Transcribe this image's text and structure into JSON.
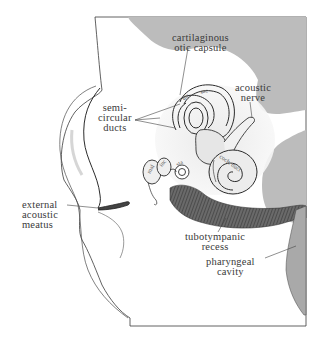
{
  "figure": {
    "type": "anatomical illustration",
    "colors": {
      "capsule_gray": "#bdbdbd",
      "line": "#2b2b2b",
      "shade": "#d9d9d9",
      "recess_dark": "#5a5a5a",
      "background": "#ffffff"
    }
  },
  "labels": {
    "cartilaginous_otic_capsule": {
      "line1": "cartilaginous",
      "line2": "otic capsule"
    },
    "acoustic_nerve": {
      "line1": "acoustic",
      "line2": "nerve"
    },
    "semicircular_ducts": {
      "line1": "semi-",
      "line2": "circular",
      "line3": "ducts"
    },
    "external_acoustic_meatus": {
      "line1": "external",
      "line2": "acoustic",
      "line3": "meatus"
    },
    "tubotympanic_recess": {
      "line1": "tubotympanic",
      "line2": "recess"
    },
    "pharyngeal_cavity": {
      "line1": "pharyngeal",
      "line2": "cavity"
    }
  },
  "structure_tags": {
    "malleus": "mal",
    "incus": "inc",
    "stapes": "sta",
    "cochlear_duct": "coch. duct",
    "utricle": "utr",
    "saccule": "sac"
  }
}
